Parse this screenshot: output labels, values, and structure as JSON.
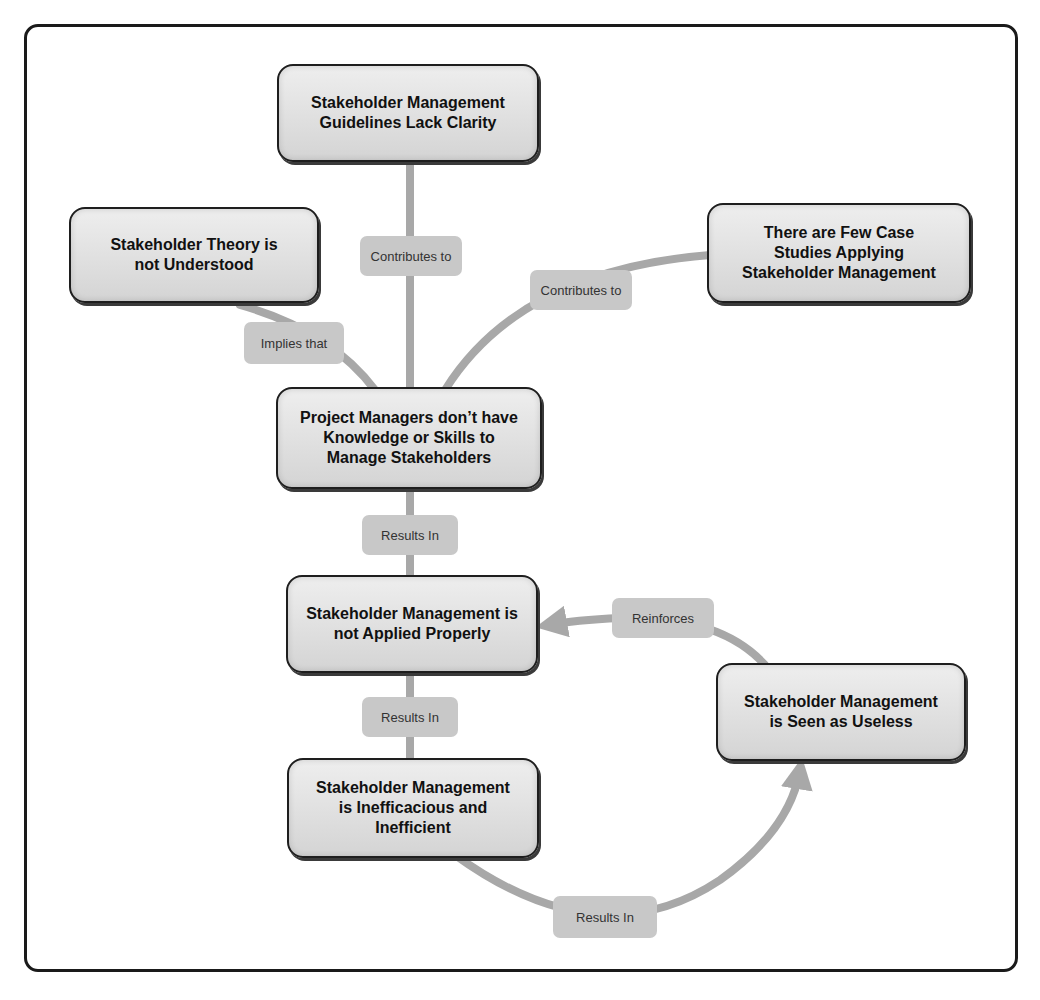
{
  "diagram": {
    "type": "concept-map",
    "nodes": [
      {
        "id": "guidelines",
        "text": "Stakeholder Management Guidelines Lack Clarity"
      },
      {
        "id": "theory",
        "text": "Stakeholder Theory is not Understood"
      },
      {
        "id": "case_studies",
        "text": "There are Few Case Studies Applying Stakeholder Management"
      },
      {
        "id": "pm_skills",
        "text": "Project Managers don’t have Knowledge or Skills to Manage Stakeholders"
      },
      {
        "id": "not_applied",
        "text": "Stakeholder Management is not Applied Properly"
      },
      {
        "id": "useless",
        "text": "Stakeholder Management is Seen as Useless"
      },
      {
        "id": "inefficacious",
        "text": "Stakeholder Management is Inefficacious and Inefficient"
      }
    ],
    "edges": [
      {
        "from": "guidelines",
        "to": "pm_skills",
        "label": "Contributes to"
      },
      {
        "from": "theory",
        "to": "pm_skills",
        "label": "Implies that"
      },
      {
        "from": "case_studies",
        "to": "pm_skills",
        "label": "Contributes to"
      },
      {
        "from": "pm_skills",
        "to": "not_applied",
        "label": "Results In"
      },
      {
        "from": "not_applied",
        "to": "inefficacious",
        "label": "Results In"
      },
      {
        "from": "inefficacious",
        "to": "useless",
        "label": "Results In"
      },
      {
        "from": "useless",
        "to": "not_applied",
        "label": "Reinforces"
      }
    ]
  },
  "colors": {
    "connector": "#a8a8a8",
    "label_bg": "#c8c8c8",
    "node_border": "#1e1e1e",
    "frame": "#1a1a1a"
  }
}
